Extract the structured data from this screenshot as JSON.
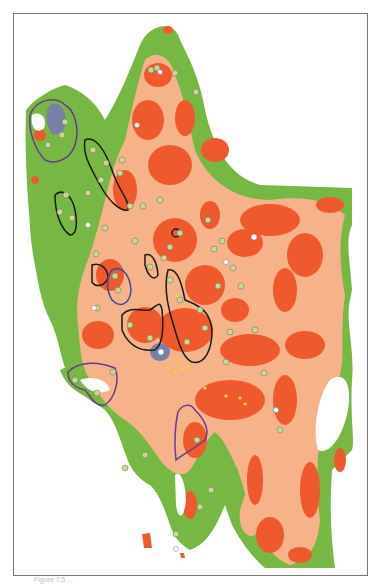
{
  "figure": {
    "type": "thematic-map",
    "caption": "Figure 7.5 ..."
  },
  "legend_colors": {
    "outer_zone": "#76b843",
    "middle_zone": "#f6b38a",
    "inner_zone": "#ee5a2e",
    "lake": "#7a7fa8",
    "outline_black": "#1a1a1a",
    "outline_purple": "#6b3a8c",
    "outline_blue": "#3f4aa0"
  },
  "stations": {
    "marker_style": "small white/green circle with tiny label",
    "count_visible_approx": 70
  }
}
